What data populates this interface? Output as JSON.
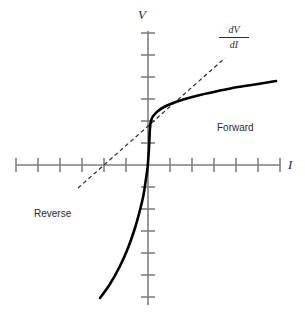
{
  "chart_data": {
    "type": "line",
    "title": "",
    "subtitle": "",
    "xlabel": "I",
    "ylabel": "V",
    "grid": false,
    "legend_position": "none",
    "axes": {
      "x_axis": {
        "label": "I",
        "orientation": "horizontal",
        "origin_px": 148,
        "y_px": 165,
        "start_px": 16,
        "end_px": 281,
        "tick_spacing_px": 22,
        "tick_length_px": 14,
        "tick_count_negative": 6,
        "tick_count_positive": 6,
        "tick_labels": []
      },
      "y_axis": {
        "label": "V",
        "orientation": "vertical",
        "origin_px": 165,
        "x_px": 148,
        "start_px": 31,
        "end_px": 305,
        "tick_spacing_px": 22,
        "tick_length_px": 14,
        "tick_count_positive": 6,
        "tick_count_negative": 6,
        "tick_labels": []
      }
    },
    "series": [
      {
        "name": "diode-characteristic-curve",
        "style": "solid",
        "color": "#000000",
        "width_px": 2.6,
        "points_px": [
          [
            100,
            298
          ],
          [
            110,
            284
          ],
          [
            120,
            266
          ],
          [
            128,
            248
          ],
          [
            135,
            228
          ],
          [
            140,
            210
          ],
          [
            143.5,
            195
          ],
          [
            145.5,
            182
          ],
          [
            147,
            172
          ],
          [
            147.8,
            165
          ],
          [
            148.4,
            157
          ],
          [
            149,
            148
          ],
          [
            149.4,
            139
          ],
          [
            149.8,
            131
          ],
          [
            150.4,
            124
          ],
          [
            151.6,
            119
          ],
          [
            154,
            115
          ],
          [
            158,
            111
          ],
          [
            164,
            107
          ],
          [
            173,
            103
          ],
          [
            185,
            99
          ],
          [
            200,
            95
          ],
          [
            218,
            91
          ],
          [
            238,
            87
          ],
          [
            258,
            84
          ],
          [
            276,
            81
          ]
        ]
      },
      {
        "name": "dynamic-resistance-tangent",
        "style": "dashed",
        "color": "#2b2b2b",
        "width_px": 1.2,
        "dash_px": "4,3",
        "points_px": [
          [
            78,
            188
          ],
          [
            225,
            58
          ]
        ]
      }
    ],
    "annotations": [
      {
        "name": "slope-annotation",
        "numerator": "dV",
        "denominator": "dI",
        "type": "fraction",
        "x_px": 234,
        "y_px": 36
      },
      {
        "name": "forward-region-label",
        "text": "Forward",
        "x_px": 217,
        "y_px": 123
      },
      {
        "name": "reverse-region-label",
        "text": "Reverse",
        "x_px": 34,
        "y_px": 209
      }
    ]
  },
  "labels": {
    "y_axis": "V",
    "x_axis": "I",
    "forward": "Forward",
    "reverse": "Reverse",
    "slope_numerator": "dV",
    "slope_denominator": "dI"
  },
  "colors": {
    "background": "#ffffff",
    "axis": "#808080",
    "tick": "#808080",
    "curve": "#000000",
    "tangent": "#2b2b2b",
    "text": "#2b2b2b"
  }
}
